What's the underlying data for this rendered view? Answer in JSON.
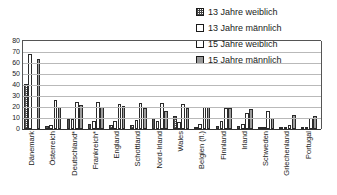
{
  "chart_data": {
    "type": "bar",
    "title": "",
    "subtitle": "",
    "xlabel": "",
    "ylabel": "",
    "ylim": [
      0,
      80
    ],
    "yticks": [
      "0",
      "10",
      "20",
      "30",
      "40",
      "50",
      "60",
      "70",
      "80"
    ],
    "grid": true,
    "legend_position": "top-right",
    "categories": [
      "Dänemark",
      "Österreich",
      "Deutschland*",
      "Frankreich*",
      "England",
      "Schottland",
      "Nord-Irland",
      "Wales",
      "Belgien (fl.)",
      "Finnland",
      "Irland",
      "Schweden",
      "Griechenland",
      "Portugal"
    ],
    "series": [
      {
        "name": "13 Jahre weiblich",
        "pattern": "dotted",
        "color": "#ffffff",
        "values": [
          41,
          3,
          9,
          5,
          4,
          4,
          10,
          12,
          2,
          3,
          3,
          1,
          1,
          1
        ]
      },
      {
        "name": "13 Jahre männlich",
        "pattern": "white",
        "color": "#ffffff",
        "values": [
          68,
          4,
          9,
          7,
          7,
          8,
          7,
          6,
          5,
          7,
          5,
          1,
          2,
          2
        ]
      },
      {
        "name": "15 Jahre weiblich",
        "pattern": "white",
        "color": "#ffffff",
        "values": [
          0,
          26,
          25,
          25,
          23,
          24,
          24,
          23,
          20,
          19,
          15,
          16,
          4,
          10
        ]
      },
      {
        "name": "15 Jahre männlich",
        "pattern": "gray",
        "color": "#9d9d9d",
        "values": [
          64,
          20,
          22,
          20,
          21,
          19,
          16,
          19,
          20,
          19,
          18,
          10,
          13,
          12
        ]
      }
    ]
  },
  "legend": {
    "items": [
      {
        "label": "13 Jahre weiblich",
        "swatch": "dotted"
      },
      {
        "label": "13 Jahre männlich",
        "swatch": "white"
      },
      {
        "label": "15 Jahre weiblich",
        "swatch": "white"
      },
      {
        "label": "15 Jahre männlich",
        "swatch": "gray"
      }
    ]
  }
}
